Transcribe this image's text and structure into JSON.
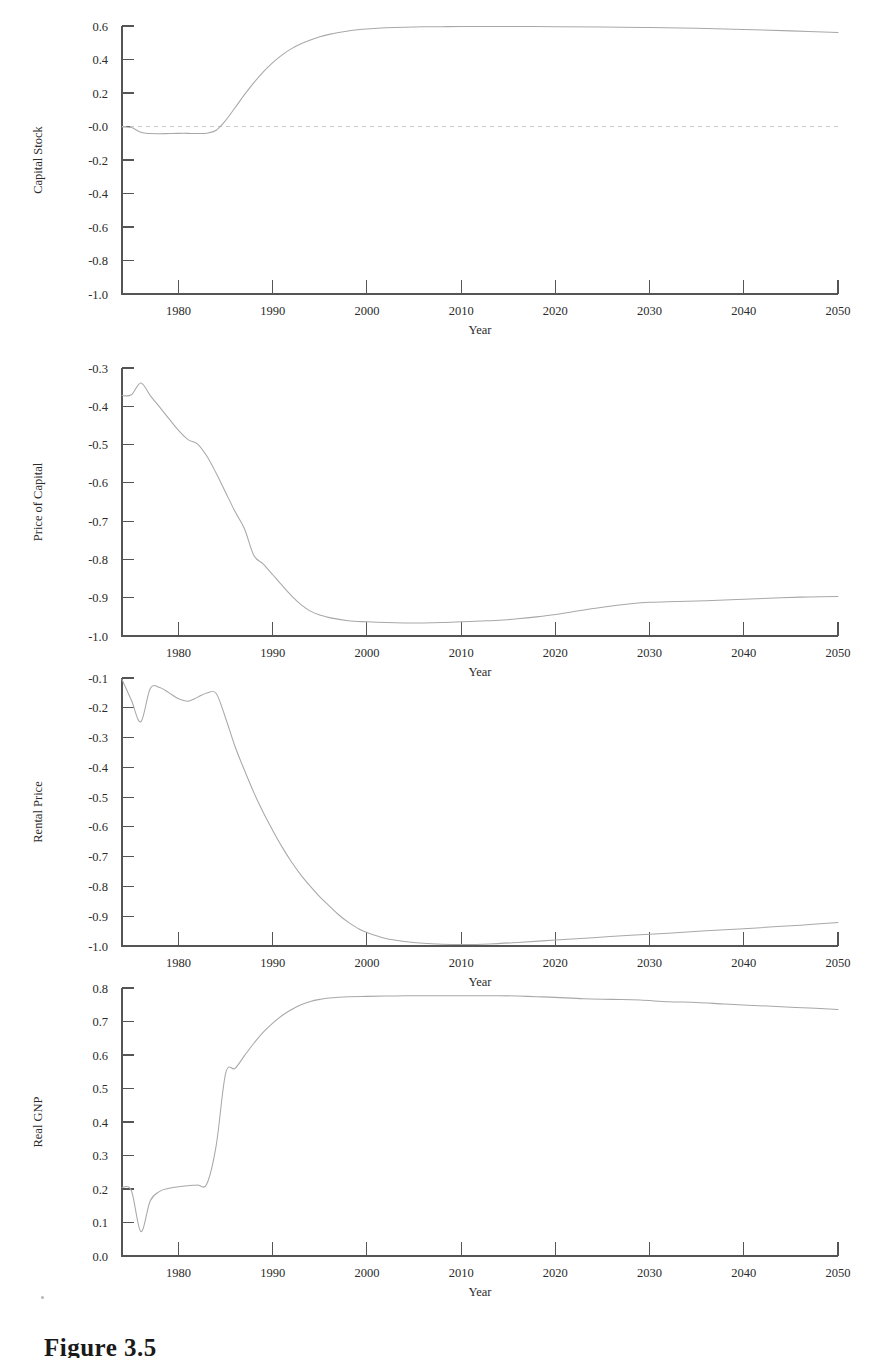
{
  "figure": {
    "caption": "Figure 3.5",
    "xlabel": "Year",
    "x_ticks": [
      "1980",
      "1990",
      "2000",
      "2010",
      "2020",
      "2030",
      "2040",
      "2050"
    ],
    "x_tick_values": [
      1980,
      1990,
      2000,
      2010,
      2020,
      2030,
      2040,
      2050
    ],
    "xlim": [
      1974,
      2050
    ]
  },
  "chart_data": [
    {
      "type": "line",
      "title": "",
      "ylabel": "Capital Stock",
      "xlabel": "Year",
      "ylim": [
        -1.0,
        0.6
      ],
      "xlim": [
        1974,
        2050
      ],
      "grid": false,
      "legend": "none",
      "y_ticks": [
        0.6,
        0.4,
        0.2,
        -0.0,
        -0.2,
        -0.4,
        -0.6,
        -0.8,
        -1.0
      ],
      "y_tick_labels": [
        "0.6",
        "0.4",
        "0.2",
        "-0.0",
        "-0.2",
        "-0.4",
        "-0.6",
        "-0.8",
        "-1.0"
      ],
      "annotations": [
        {
          "kind": "zero-reference-line",
          "y": 0.0,
          "style": "dashed"
        }
      ],
      "series": [
        {
          "name": "Capital Stock",
          "x": [
            1974,
            1975,
            1976,
            1977,
            1978,
            1979,
            1980,
            1981,
            1982,
            1983,
            1984,
            1985,
            1986,
            1987,
            1988,
            1989,
            1990,
            1991,
            1992,
            1993,
            1994,
            1995,
            1996,
            1997,
            1998,
            1999,
            2000,
            2002,
            2004,
            2006,
            2008,
            2010,
            2015,
            2020,
            2025,
            2030,
            2035,
            2040,
            2045,
            2050
          ],
          "values": [
            -0.003,
            -0.006,
            -0.035,
            -0.042,
            -0.043,
            -0.042,
            -0.041,
            -0.041,
            -0.042,
            -0.04,
            -0.022,
            0.036,
            0.112,
            0.19,
            0.262,
            0.326,
            0.381,
            0.428,
            0.465,
            0.494,
            0.517,
            0.536,
            0.55,
            0.561,
            0.57,
            0.577,
            0.582,
            0.589,
            0.593,
            0.595,
            0.596,
            0.597,
            0.597,
            0.596,
            0.594,
            0.591,
            0.586,
            0.579,
            0.571,
            0.561
          ]
        }
      ]
    },
    {
      "type": "line",
      "title": "",
      "ylabel": "Price of Capital",
      "xlabel": "Year",
      "ylim": [
        -1.0,
        -0.3
      ],
      "xlim": [
        1974,
        2050
      ],
      "grid": false,
      "legend": "none",
      "y_ticks": [
        -0.3,
        -0.4,
        -0.5,
        -0.6,
        -0.7,
        -0.8,
        -0.9,
        -1.0
      ],
      "y_tick_labels": [
        "-0.3",
        "-0.4",
        "-0.5",
        "-0.6",
        "-0.7",
        "-0.8",
        "-0.9",
        "-1.0"
      ],
      "annotations": [],
      "series": [
        {
          "name": "Price of Capital",
          "x": [
            1974,
            1975,
            1976,
            1977,
            1978,
            1979,
            1980,
            1981,
            1982,
            1983,
            1984,
            1985,
            1986,
            1987,
            1988,
            1989,
            1990,
            1991,
            1992,
            1993,
            1994,
            1995,
            1996,
            1998,
            2000,
            2002,
            2004,
            2006,
            2008,
            2010,
            2012,
            2014,
            2016,
            2018,
            2020,
            2022,
            2025,
            2028,
            2030,
            2033,
            2036,
            2040,
            2044,
            2047,
            2050
          ],
          "values": [
            -0.372,
            -0.37,
            -0.339,
            -0.372,
            -0.402,
            -0.433,
            -0.463,
            -0.487,
            -0.498,
            -0.53,
            -0.575,
            -0.625,
            -0.675,
            -0.72,
            -0.79,
            -0.812,
            -0.84,
            -0.868,
            -0.895,
            -0.918,
            -0.935,
            -0.945,
            -0.952,
            -0.96,
            -0.963,
            -0.965,
            -0.966,
            -0.966,
            -0.965,
            -0.963,
            -0.961,
            -0.959,
            -0.955,
            -0.95,
            -0.944,
            -0.936,
            -0.925,
            -0.916,
            -0.912,
            -0.91,
            -0.908,
            -0.904,
            -0.9,
            -0.898,
            -0.897
          ]
        }
      ]
    },
    {
      "type": "line",
      "title": "",
      "ylabel": "Rental Price",
      "xlabel": "Year",
      "ylim": [
        -1.0,
        -0.1
      ],
      "xlim": [
        1974,
        2050
      ],
      "grid": false,
      "legend": "none",
      "y_ticks": [
        -0.1,
        -0.2,
        -0.3,
        -0.4,
        -0.5,
        -0.6,
        -0.7,
        -0.8,
        -0.9,
        -1.0
      ],
      "y_tick_labels": [
        "-0.1",
        "-0.2",
        "-0.3",
        "-0.4",
        "-0.5",
        "-0.6",
        "-0.7",
        "-0.8",
        "-0.9",
        "-1.0"
      ],
      "annotations": [],
      "series": [
        {
          "name": "Rental Price",
          "x": [
            1974,
            1975,
            1976,
            1977,
            1978,
            1979,
            1980,
            1981,
            1982,
            1983,
            1984,
            1985,
            1986,
            1987,
            1988,
            1989,
            1990,
            1991,
            1992,
            1993,
            1994,
            1995,
            1996,
            1997,
            1998,
            1999,
            2000,
            2002,
            2004,
            2006,
            2008,
            2010,
            2013,
            2016,
            2020,
            2024,
            2028,
            2032,
            2036,
            2040,
            2044,
            2047,
            2050
          ],
          "values": [
            -0.105,
            -0.175,
            -0.247,
            -0.135,
            -0.132,
            -0.15,
            -0.17,
            -0.178,
            -0.165,
            -0.15,
            -0.152,
            -0.235,
            -0.33,
            -0.41,
            -0.485,
            -0.552,
            -0.612,
            -0.668,
            -0.718,
            -0.762,
            -0.8,
            -0.835,
            -0.865,
            -0.895,
            -0.92,
            -0.94,
            -0.955,
            -0.975,
            -0.985,
            -0.991,
            -0.994,
            -0.995,
            -0.993,
            -0.988,
            -0.98,
            -0.972,
            -0.964,
            -0.957,
            -0.949,
            -0.942,
            -0.934,
            -0.928,
            -0.921
          ]
        }
      ]
    },
    {
      "type": "line",
      "title": "",
      "ylabel": "Real GNP",
      "xlabel": "Year",
      "ylim": [
        0.0,
        0.8
      ],
      "xlim": [
        1974,
        2050
      ],
      "grid": false,
      "legend": "none",
      "y_ticks": [
        0.8,
        0.7,
        0.6,
        0.5,
        0.4,
        0.3,
        0.2,
        0.1,
        0.0
      ],
      "y_tick_labels": [
        "0.8",
        "0.7",
        "0.6",
        "0.5",
        "0.4",
        "0.3",
        "0.2",
        "0.1",
        "0.0"
      ],
      "annotations": [],
      "series": [
        {
          "name": "Real GNP",
          "x": [
            1974,
            1975,
            1976,
            1977,
            1978,
            1979,
            1980,
            1981,
            1982,
            1983,
            1984,
            1985,
            1986,
            1987,
            1988,
            1989,
            1990,
            1991,
            1992,
            1993,
            1994,
            1995,
            1996,
            1998,
            2000,
            2002,
            2004,
            2006,
            2008,
            2010,
            2012,
            2014,
            2016,
            2018,
            2020,
            2023,
            2026,
            2029,
            2032,
            2035,
            2038,
            2041,
            2044,
            2047,
            2050
          ],
          "values": [
            0.205,
            0.195,
            0.073,
            0.165,
            0.193,
            0.202,
            0.207,
            0.21,
            0.212,
            0.215,
            0.33,
            0.545,
            0.56,
            0.598,
            0.635,
            0.668,
            0.695,
            0.718,
            0.736,
            0.75,
            0.76,
            0.766,
            0.77,
            0.774,
            0.775,
            0.776,
            0.777,
            0.777,
            0.777,
            0.777,
            0.777,
            0.777,
            0.776,
            0.774,
            0.772,
            0.768,
            0.766,
            0.764,
            0.759,
            0.757,
            0.752,
            0.748,
            0.744,
            0.74,
            0.736
          ]
        }
      ]
    }
  ]
}
